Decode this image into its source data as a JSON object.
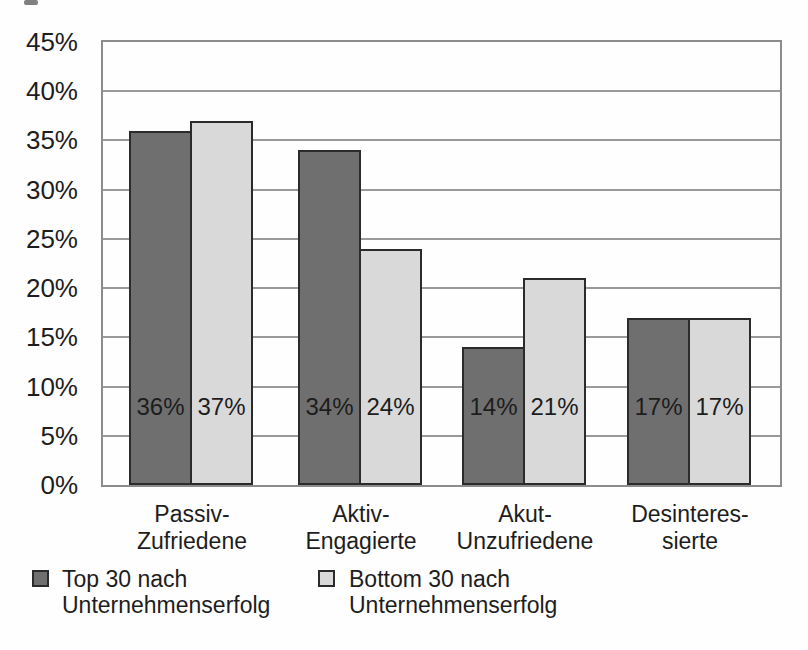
{
  "chart_data": {
    "type": "bar",
    "title": "",
    "xlabel": "",
    "ylabel": "",
    "ylim": [
      0,
      45
    ],
    "ytick_step": 5,
    "yticks": [
      "45%",
      "40%",
      "35%",
      "30%",
      "25%",
      "20%",
      "15%",
      "10%",
      "5%",
      "0%"
    ],
    "grid": "horizontal",
    "legend_position": "bottom-left",
    "categories": [
      "Passiv-\nZufriedene",
      "Aktiv-\nEngagierte",
      "Akut-\nUnzufriedene",
      "Desinteres-\nsierte"
    ],
    "series": [
      {
        "name": "Top 30 nach\nUnternehmenserfolg",
        "values": [
          36,
          34,
          14,
          17
        ],
        "value_labels": [
          "36%",
          "34%",
          "14%",
          "17%"
        ],
        "color": "#6f6f6f"
      },
      {
        "name": "Bottom 30 nach\nUnternehmenserfolg",
        "values": [
          37,
          24,
          21,
          17
        ],
        "value_labels": [
          "37%",
          "24%",
          "21%",
          "17%"
        ],
        "color": "#d9d9d9"
      }
    ],
    "colors": {
      "bar_border": "#2b2b2b",
      "grid_line": "#9a9a9a",
      "plot_border": "#8c8c8c",
      "text": "#1d1d1d",
      "background": "#fefefe"
    }
  }
}
